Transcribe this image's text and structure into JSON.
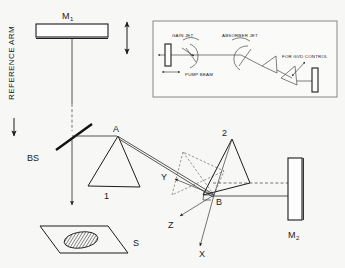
{
  "figure": {
    "background_color": "#f7f7f5",
    "line_color": "#1c1c1c"
  },
  "main_diagram": {
    "reference_arm_label": "REFERENCE ARM",
    "mirror_m1_label": "M",
    "mirror_m1_sub": "1",
    "mirror_m2_label": "M",
    "mirror_m2_sub": "2",
    "beamsplitter_label": "BS",
    "sample_label": "S",
    "prism1_label": "1",
    "prism2_label": "2",
    "vertex_a_label": "A",
    "vertex_b_label": "B",
    "axis_x_label": "X",
    "axis_y_label": "Y",
    "axis_z_label": "Z"
  },
  "inset": {
    "gain_jet_label": "GAIN JET",
    "absorber_jet_label": "ABSORBER JET",
    "pump_beam_label": "PUMP BEAM",
    "gvd_control_label": "FOR GVD CONTROL"
  }
}
